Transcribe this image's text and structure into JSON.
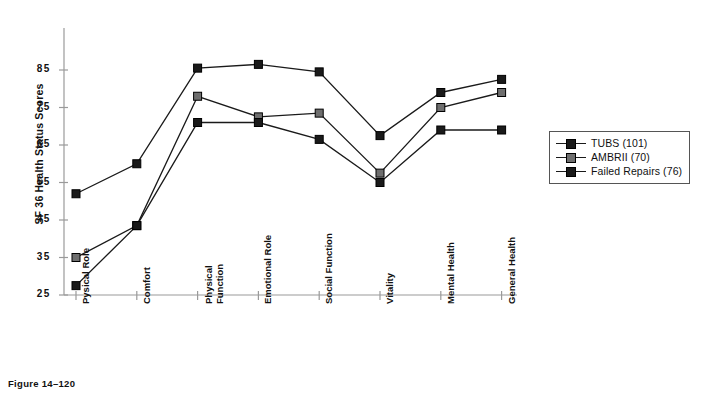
{
  "caption": "Figure 14–120",
  "legend": {
    "position": "right",
    "entries": [
      {
        "label": "TUBS (101)",
        "color": "#1a1a1a"
      },
      {
        "label": "AMBRII (70)",
        "color": "#6e6e6e"
      },
      {
        "label": "Failed Repairs (76)",
        "color": "#1a1a1a"
      }
    ]
  },
  "chart_data": {
    "type": "line",
    "title": "",
    "xlabel": "",
    "ylabel": "SF 36 Health Status Scores",
    "ylim": [
      25,
      88
    ],
    "yticks": [
      25,
      35,
      45,
      55,
      65,
      75,
      85
    ],
    "grid": false,
    "categories": [
      "Pysical Role",
      "Comfort",
      "Physical Function",
      "Emotional Role",
      "Social Function",
      "Vitality",
      "Mental Health",
      "General Health"
    ],
    "series": [
      {
        "name": "TUBS (101)",
        "color": "#1a1a1a",
        "marker": "square",
        "values": [
          52,
          60,
          85.5,
          86.5,
          84.5,
          67.5,
          79,
          82.5
        ]
      },
      {
        "name": "AMBRII (70)",
        "color": "#6e6e6e",
        "marker": "square",
        "values": [
          35,
          43.5,
          78,
          72.5,
          73.5,
          57.5,
          75,
          79
        ]
      },
      {
        "name": "Failed Repairs (76)",
        "color": "#1a1a1a",
        "marker": "square",
        "values": [
          27.5,
          43.5,
          71,
          71,
          66.5,
          55,
          69,
          69
        ]
      }
    ]
  }
}
